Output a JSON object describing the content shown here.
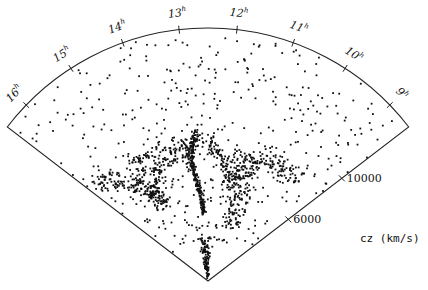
{
  "chart_data": {
    "type": "scatter",
    "title": "",
    "projection": "wedge (cone) diagram, right ascension vs. redshift velocity",
    "xlabel": "right ascension (hours)",
    "ylabel": "cz (km/s)",
    "ra_ticks": [
      "16h",
      "15h",
      "14h",
      "13h",
      "12h",
      "11h",
      "10h",
      "9h"
    ],
    "ra_tick_labels_display": [
      {
        "main": "16",
        "sup": "h"
      },
      {
        "main": "15",
        "sup": "h"
      },
      {
        "main": "14",
        "sup": "h"
      },
      {
        "main": "13",
        "sup": "h"
      },
      {
        "main": "12",
        "sup": "h"
      },
      {
        "main": "11",
        "sup": "h"
      },
      {
        "main": "10",
        "sup": "h"
      },
      {
        "main": "9",
        "sup": "h"
      }
    ],
    "velocity_ticks": [
      6000,
      10000
    ],
    "velocity_tick_labels": [
      "6000",
      "10000"
    ],
    "axis_title": "cz (km/s)",
    "velocity_range": [
      0,
      15000
    ],
    "grid": false,
    "legend": null,
    "point_color": "#111111",
    "line_color": "#222222",
    "structures": [
      {
        "name": "Coma cluster finger (central)",
        "ra_h": 12.95,
        "cz_from": 4000,
        "cz_to": 9000,
        "spread_ra": 0.06,
        "spread_cz": 250,
        "n": 220
      },
      {
        "name": "Great Wall arc",
        "arc": true,
        "ra_from": 16.3,
        "ra_to": 9.3,
        "cz": 7500,
        "spread_cz": 700,
        "n": 520
      },
      {
        "name": "Left void rim",
        "ra_h": 14.8,
        "cz_from": 5000,
        "cz_to": 8500,
        "spread_ra": 0.35,
        "spread_cz": 300,
        "n": 140
      },
      {
        "name": "Right void rim",
        "ra_h": 11.0,
        "cz_from": 3500,
        "cz_to": 8000,
        "spread_ra": 0.3,
        "spread_cz": 400,
        "n": 160
      },
      {
        "name": "Near apex concentration",
        "ra_h": 12.7,
        "cz_from": 300,
        "cz_to": 2500,
        "spread_ra": 0.35,
        "spread_cz": 300,
        "n": 110
      },
      {
        "name": "Background field",
        "field": true,
        "cz_from": 9000,
        "cz_to": 14800,
        "n": 260
      },
      {
        "name": "Mid field",
        "field": true,
        "cz_from": 2500,
        "cz_to": 9000,
        "n": 180
      }
    ],
    "geometry": {
      "apex": [
        208,
        281
      ],
      "radius_px": 253,
      "ra_left_h": 16.5,
      "ra_right_h": 8.5,
      "angle_left_deg": 217.5,
      "angle_right_deg": 322.5,
      "seed": 1986
    }
  }
}
